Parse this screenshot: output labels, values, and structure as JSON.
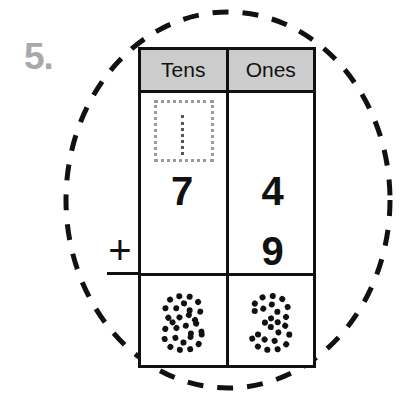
{
  "worksheet": {
    "problem_number": "5.",
    "number_color": "#a9a9a9"
  },
  "annotation": {
    "circle_style": "dashed-ellipse",
    "circle_color": "#111111"
  },
  "operator": {
    "symbol": "+",
    "name": "plus-sign"
  },
  "table": {
    "columns": [
      {
        "key": "tens",
        "label": "Tens"
      },
      {
        "key": "ones",
        "label": "Ones"
      }
    ],
    "header_bg": "#cccccc",
    "border_color": "#111111",
    "carry": {
      "value": "1",
      "column": "tens",
      "style": "dotted-trace-in-box",
      "box_border_color": "#9a9a9a"
    },
    "addend_1": {
      "tens": "7",
      "ones": "4"
    },
    "addend_2": {
      "tens": "",
      "ones": "9"
    },
    "answer": {
      "tens": "8",
      "ones": "3",
      "style": "dotted-trace"
    }
  }
}
